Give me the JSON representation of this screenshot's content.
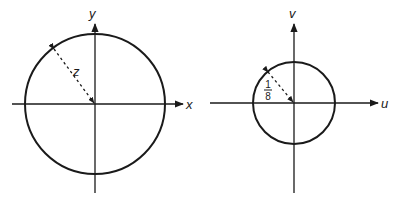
{
  "diagrams": [
    {
      "name": "z-plane",
      "x_axis_label": "x",
      "y_axis_label": "y",
      "radius_label": "z",
      "center": [
        95,
        104
      ],
      "radius": 70
    },
    {
      "name": "w-plane",
      "x_axis_label": "u",
      "y_axis_label": "v",
      "radius_label_numerator": "1",
      "radius_label_denominator": "8",
      "center": [
        294,
        103
      ],
      "radius": 41
    }
  ]
}
